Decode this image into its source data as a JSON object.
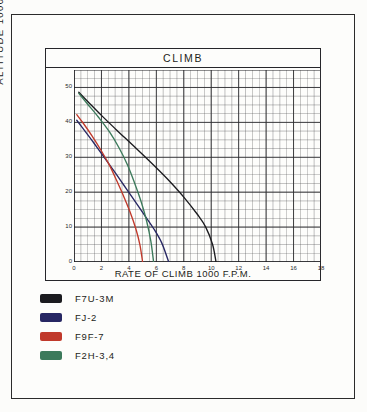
{
  "frame": {
    "name": "scanned-page-border"
  },
  "chart_data": {
    "type": "line",
    "title": "CLIMB",
    "xlabel": "RATE OF CLIMB 1000 F.P.M.",
    "ylabel": "ALTITUDE 1000 FT",
    "xlim": [
      0,
      18
    ],
    "ylim": [
      0,
      55
    ],
    "xticks": [
      0,
      2,
      4,
      6,
      8,
      10,
      12,
      14,
      16,
      18
    ],
    "yticks": [
      0,
      10,
      20,
      30,
      40,
      50
    ],
    "xtick_labels": [
      "0",
      "2",
      "4",
      "6",
      "8",
      "10",
      "12",
      "14",
      "16",
      "18"
    ],
    "ytick_labels": [
      "0",
      "10",
      "20",
      "30",
      "40",
      "50"
    ],
    "grid": true,
    "grid_minor_x": 0.5,
    "grid_minor_y": 2.5,
    "legend_position": "below-plot",
    "series": [
      {
        "name": "F7U-3M",
        "color": "#1b1b1f",
        "points": [
          [
            0.35,
            48.6
          ],
          [
            1.0,
            46.0
          ],
          [
            2.0,
            42.0
          ],
          [
            3.0,
            38.2
          ],
          [
            4.0,
            34.5
          ],
          [
            5.0,
            30.8
          ],
          [
            6.0,
            27.0
          ],
          [
            7.0,
            23.0
          ],
          [
            8.0,
            18.6
          ],
          [
            9.0,
            13.6
          ],
          [
            9.6,
            10.0
          ],
          [
            10.1,
            5.0
          ],
          [
            10.35,
            0.0
          ]
        ]
      },
      {
        "name": "FJ-2",
        "color": "#272763",
        "points": [
          [
            0.2,
            40.6
          ],
          [
            0.8,
            37.5
          ],
          [
            1.5,
            33.8
          ],
          [
            2.2,
            30.0
          ],
          [
            3.0,
            25.6
          ],
          [
            3.6,
            22.2
          ],
          [
            4.2,
            18.8
          ],
          [
            5.0,
            14.2
          ],
          [
            5.8,
            9.6
          ],
          [
            6.4,
            5.4
          ],
          [
            6.9,
            0.0
          ]
        ]
      },
      {
        "name": "F9F-7",
        "color": "#c0392b",
        "points": [
          [
            0.2,
            42.2
          ],
          [
            0.7,
            39.6
          ],
          [
            1.3,
            36.2
          ],
          [
            2.0,
            31.8
          ],
          [
            2.6,
            27.6
          ],
          [
            3.1,
            23.4
          ],
          [
            3.6,
            19.0
          ],
          [
            4.1,
            14.2
          ],
          [
            4.5,
            9.6
          ],
          [
            4.8,
            5.0
          ],
          [
            5.0,
            0.0
          ]
        ]
      },
      {
        "name": "F2H-3,4",
        "color": "#3c7a5b",
        "points": [
          [
            0.35,
            48.3
          ],
          [
            1.0,
            45.2
          ],
          [
            1.8,
            41.4
          ],
          [
            2.6,
            37.2
          ],
          [
            3.3,
            32.6
          ],
          [
            3.9,
            27.8
          ],
          [
            4.4,
            22.8
          ],
          [
            4.9,
            17.2
          ],
          [
            5.3,
            11.6
          ],
          [
            5.6,
            6.0
          ],
          [
            5.8,
            0.0
          ]
        ]
      }
    ]
  },
  "legend": {
    "items": [
      {
        "label": "F7U-3M",
        "color": "#1b1b1f"
      },
      {
        "label": "FJ-2",
        "color": "#272763"
      },
      {
        "label": "F9F-7",
        "color": "#c0392b"
      },
      {
        "label": "F2H-3,4",
        "color": "#3c7a5b"
      }
    ]
  }
}
